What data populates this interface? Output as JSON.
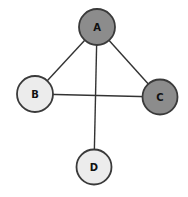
{
  "diagram": {
    "type": "graph",
    "directed": false,
    "nodes": [
      {
        "id": "A",
        "label": "A",
        "cx": 97,
        "cy": 27,
        "r": 18,
        "fill": "#8c8c8c"
      },
      {
        "id": "B",
        "label": "B",
        "cx": 35,
        "cy": 94,
        "r": 18,
        "fill": "#ececec"
      },
      {
        "id": "C",
        "label": "C",
        "cx": 160,
        "cy": 97,
        "r": 17.5,
        "fill": "#8c8c8c"
      },
      {
        "id": "D",
        "label": "D",
        "cx": 94,
        "cy": 167,
        "r": 17.5,
        "fill": "#ececec"
      }
    ],
    "edges": [
      {
        "from": "A",
        "to": "B"
      },
      {
        "from": "A",
        "to": "C"
      },
      {
        "from": "A",
        "to": "D"
      },
      {
        "from": "B",
        "to": "C"
      }
    ],
    "colors": {
      "highlighted_node": "#8c8c8c",
      "normal_node": "#ececec",
      "stroke": "#3a3a3a",
      "edge": "#333333"
    }
  }
}
